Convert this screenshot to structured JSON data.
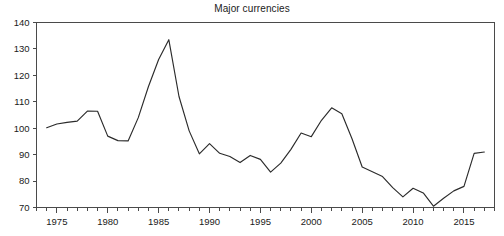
{
  "chart_data": {
    "type": "line",
    "title": "Major currencies",
    "xlabel": "",
    "ylabel": "",
    "xlim": [
      1973.2,
      1973.2
    ],
    "ylim": [
      70,
      140
    ],
    "grid": false,
    "legend": null,
    "legend_position": "none",
    "line_color": "#2b2b2b",
    "y_ticks": [
      70,
      80,
      90,
      100,
      110,
      120,
      130,
      140
    ],
    "x_ticks": [
      1975,
      1980,
      1985,
      1990,
      1995,
      2000,
      2005,
      2010,
      2015
    ],
    "x_minor_tick_interval": 1,
    "x_axis_start": 1973,
    "x_axis_end": 2018,
    "series": [
      {
        "name": "Major currencies",
        "x": [
          1974,
          1975,
          1976,
          1977,
          1978,
          1979,
          1980,
          1981,
          1982,
          1983,
          1984,
          1985,
          1986,
          1987,
          1988,
          1989,
          1990,
          1991,
          1992,
          1993,
          1994,
          1995,
          1996,
          1997,
          1998,
          1999,
          2000,
          2001,
          2002,
          2003,
          2004,
          2005,
          2006,
          2007,
          2008,
          2009,
          2010,
          2011,
          2012,
          2013,
          2014,
          2015,
          2016,
          2017
        ],
        "values": [
          100.2,
          101.6,
          102.2,
          102.7,
          106.5,
          106.4,
          97.0,
          95.3,
          95.2,
          104.0,
          115.8,
          126.0,
          133.5,
          112.0,
          99.0,
          90.3,
          94.2,
          90.5,
          89.3,
          87.0,
          89.7,
          88.2,
          83.4,
          86.8,
          92.0,
          98.2,
          96.8,
          103.0,
          107.7,
          105.5,
          96.0,
          85.3,
          83.5,
          81.7,
          77.5,
          74.0,
          77.3,
          75.5,
          70.5,
          73.5,
          76.3,
          78.0,
          90.5,
          91.0
        ]
      }
    ]
  },
  "axes": {
    "y_tick_labels": [
      "140",
      "130",
      "120",
      "110",
      "100",
      "90",
      "80",
      "70"
    ],
    "x_tick_labels": [
      "1975",
      "1980",
      "1985",
      "1990",
      "1995",
      "2000",
      "2005",
      "2010",
      "2015"
    ]
  }
}
